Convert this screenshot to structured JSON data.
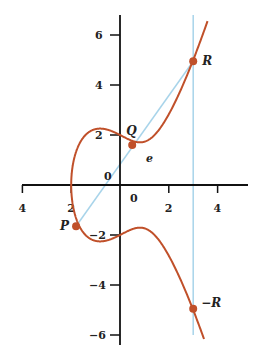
{
  "diagram": {
    "title": "",
    "curve_equation": "y^2 = x^3 - 2x + 4",
    "curve": {
      "a": -2,
      "b": 4
    },
    "colors": {
      "curve": "#c0502a",
      "point": "#c0502a",
      "secant_line": "#a8d4ea",
      "vertical_line": "#a8d4ea",
      "axis": "#111111"
    },
    "x_ticks": [
      {
        "value": -4,
        "label": "4"
      },
      {
        "value": -2,
        "label": "2"
      },
      {
        "value": 0,
        "label": "0"
      },
      {
        "value": 2,
        "label": "2"
      },
      {
        "value": 4,
        "label": "4"
      }
    ],
    "y_ticks": [
      {
        "value": 6,
        "label": "6"
      },
      {
        "value": 4,
        "label": "4"
      },
      {
        "value": 2,
        "label": "2"
      },
      {
        "value": -2,
        "label": "−2"
      },
      {
        "value": -4,
        "label": "−4"
      },
      {
        "value": -6,
        "label": "−6"
      }
    ],
    "origin_label": "0",
    "points": [
      {
        "name": "P",
        "label": "P",
        "x": -1.8,
        "y": -1.65
      },
      {
        "name": "Q",
        "label": "Q",
        "x": 0.5,
        "y": 1.6
      },
      {
        "name": "R",
        "label": "R",
        "x": 3.0,
        "y": 4.95
      },
      {
        "name": "neg-R",
        "label": "−R",
        "x": 3.0,
        "y": -4.95
      }
    ],
    "annotation_e": "e",
    "vertical_line_x": 3.0
  }
}
